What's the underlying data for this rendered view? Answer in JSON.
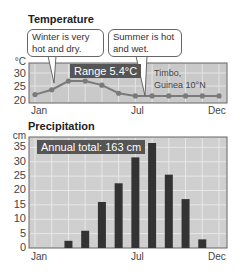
{
  "temperature": {
    "title": "Temperature",
    "unit_label": "°C",
    "y_ticks": [
      "30",
      "25",
      "20"
    ],
    "x_ticks": [
      "Jan",
      "Jul",
      "Dec"
    ],
    "range_label": "Range 5.4°C",
    "location_line1": "Timbo,",
    "location_line2": "Guinea 10°N",
    "callout_winter_line1": "Winter is very",
    "callout_winter_line2": "hot and dry.",
    "callout_summer_line1": "Summer is hot",
    "callout_summer_line2": "and wet.",
    "colors": {
      "plot_bg": "#c9c9c9",
      "line": "#7a7a7a",
      "label_bg": "#555555"
    }
  },
  "precipitation": {
    "title": "Precipitation",
    "unit_label": "cm",
    "y_ticks": [
      "35",
      "30",
      "25",
      "20",
      "15",
      "10",
      "5",
      "0"
    ],
    "x_ticks": [
      "Jan",
      "Jul",
      "Dec"
    ],
    "total_label": "Annual total: 163 cm",
    "colors": {
      "plot_bg": "#cfcfcf",
      "bar": "#333333"
    }
  },
  "chart_data": [
    {
      "type": "line",
      "title": "Temperature",
      "xlabel": "",
      "ylabel": "°C",
      "x": [
        "Jan",
        "Feb",
        "Mar",
        "Apr",
        "May",
        "Jun",
        "Jul",
        "Aug",
        "Sep",
        "Oct",
        "Nov",
        "Dec"
      ],
      "values": [
        22.0,
        23.8,
        27.0,
        27.0,
        25.5,
        22.5,
        21.5,
        21.5,
        21.5,
        21.5,
        21.5,
        21.5
      ],
      "ylim": [
        19,
        33
      ],
      "x_tick_labels": [
        "Jan",
        "Jul",
        "Dec"
      ],
      "y_tick_labels": [
        "20",
        "25",
        "30"
      ],
      "grid": true,
      "annotations": [
        "Range 5.4°C",
        "Timbo, Guinea 10°N",
        "Winter is very hot and dry.",
        "Summer is hot and wet."
      ]
    },
    {
      "type": "bar",
      "title": "Precipitation",
      "xlabel": "",
      "ylabel": "cm",
      "categories": [
        "Jan",
        "Feb",
        "Mar",
        "Apr",
        "May",
        "Jun",
        "Jul",
        "Aug",
        "Sep",
        "Oct",
        "Nov",
        "Dec"
      ],
      "values": [
        0,
        0,
        2.5,
        6,
        16,
        22.5,
        31.5,
        36.5,
        25.5,
        17,
        3,
        0
      ],
      "ylim": [
        0,
        38
      ],
      "x_tick_labels": [
        "Jan",
        "Jul",
        "Dec"
      ],
      "y_tick_labels": [
        "0",
        "5",
        "10",
        "15",
        "20",
        "25",
        "30",
        "35"
      ],
      "grid": true,
      "annotations": [
        "Annual total: 163 cm"
      ]
    }
  ]
}
